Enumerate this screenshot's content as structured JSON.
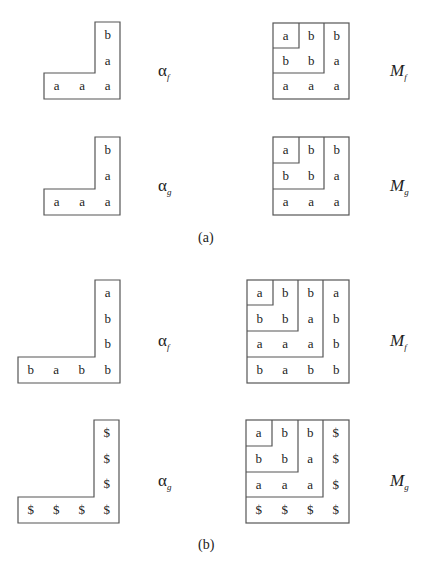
{
  "part_a": {
    "caption": "(a)",
    "alpha_f": {
      "label_sym": "α",
      "label_sub": "f",
      "column_top_to_bottom": [
        "b",
        "a",
        "a"
      ],
      "row_left_to_right": [
        "a",
        "a",
        "a"
      ]
    },
    "M_f": {
      "label_sym": "M",
      "label_sub": "f",
      "rows": [
        [
          "a",
          "b",
          "b"
        ],
        [
          "b",
          "b",
          "a"
        ],
        [
          "a",
          "a",
          "a"
        ]
      ]
    },
    "alpha_g": {
      "label_sym": "α",
      "label_sub": "g",
      "column_top_to_bottom": [
        "b",
        "a",
        "a"
      ],
      "row_left_to_right": [
        "a",
        "a",
        "a"
      ]
    },
    "M_g": {
      "label_sym": "M",
      "label_sub": "g",
      "rows": [
        [
          "a",
          "b",
          "b"
        ],
        [
          "b",
          "b",
          "a"
        ],
        [
          "a",
          "a",
          "a"
        ]
      ]
    }
  },
  "part_b": {
    "caption": "(b)",
    "alpha_f": {
      "label_sym": "α",
      "label_sub": "f",
      "column_top_to_bottom": [
        "a",
        "b",
        "b",
        "b"
      ],
      "row_left_to_right": [
        "b",
        "a",
        "b",
        "b"
      ]
    },
    "M_f": {
      "label_sym": "M",
      "label_sub": "f",
      "rows": [
        [
          "a",
          "b",
          "b",
          "a"
        ],
        [
          "b",
          "b",
          "a",
          "b"
        ],
        [
          "a",
          "a",
          "a",
          "b"
        ],
        [
          "b",
          "a",
          "b",
          "b"
        ]
      ]
    },
    "alpha_g": {
      "label_sym": "α",
      "label_sub": "g",
      "column_top_to_bottom": [
        "$",
        "$",
        "$",
        "$"
      ],
      "row_left_to_right": [
        "$",
        "$",
        "$",
        "$"
      ]
    },
    "M_g": {
      "label_sym": "M",
      "label_sub": "g",
      "rows": [
        [
          "a",
          "b",
          "b",
          "$"
        ],
        [
          "b",
          "b",
          "a",
          "$"
        ],
        [
          "a",
          "a",
          "a",
          "$"
        ],
        [
          "$",
          "$",
          "$",
          "$"
        ]
      ]
    }
  }
}
